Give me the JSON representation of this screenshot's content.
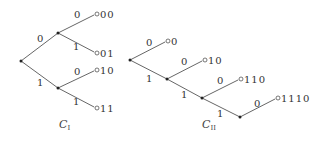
{
  "tree1": {
    "caption": "C",
    "caption_sub": "I",
    "edges": [
      {
        "from": [
          21,
          61
        ],
        "to": [
          58,
          33
        ],
        "label": "0",
        "lx": 37,
        "ly": 42
      },
      {
        "from": [
          21,
          61
        ],
        "to": [
          58,
          88
        ],
        "label": "1",
        "lx": 37,
        "ly": 86
      },
      {
        "from": [
          58,
          33
        ],
        "to": [
          96,
          14
        ],
        "label": "0",
        "lx": 74,
        "ly": 18
      },
      {
        "from": [
          58,
          33
        ],
        "to": [
          96,
          53
        ],
        "label": "1",
        "lx": 73,
        "ly": 50
      },
      {
        "from": [
          58,
          88
        ],
        "to": [
          96,
          70
        ],
        "label": "0",
        "lx": 74,
        "ly": 75
      },
      {
        "from": [
          58,
          88
        ],
        "to": [
          96,
          108
        ],
        "label": "1",
        "lx": 73,
        "ly": 105
      }
    ],
    "leaves": [
      {
        "x": 96,
        "y": 14,
        "code": "00"
      },
      {
        "x": 96,
        "y": 53,
        "code": "01"
      },
      {
        "x": 96,
        "y": 70,
        "code": "10"
      },
      {
        "x": 96,
        "y": 108,
        "code": "11"
      }
    ],
    "nodes": [
      [
        21,
        61
      ],
      [
        58,
        33
      ],
      [
        58,
        88
      ]
    ]
  },
  "tree2": {
    "caption": "C",
    "caption_sub": "II",
    "edges": [
      {
        "from": [
          130,
          60
        ],
        "to": [
          167,
          41
        ],
        "label": "0",
        "lx": 146,
        "ly": 46
      },
      {
        "from": [
          130,
          60
        ],
        "to": [
          167,
          79
        ],
        "label": "1",
        "lx": 146,
        "ly": 82
      },
      {
        "from": [
          167,
          79
        ],
        "to": [
          204,
          60
        ],
        "label": "0",
        "lx": 181,
        "ly": 65
      },
      {
        "from": [
          167,
          79
        ],
        "to": [
          202,
          98
        ],
        "label": "1",
        "lx": 181,
        "ly": 98
      },
      {
        "from": [
          202,
          98
        ],
        "to": [
          240,
          79
        ],
        "label": "0",
        "lx": 217,
        "ly": 84
      },
      {
        "from": [
          202,
          98
        ],
        "to": [
          240,
          117
        ],
        "label": "1",
        "lx": 217,
        "ly": 117
      },
      {
        "from": [
          240,
          117
        ],
        "to": [
          277,
          98
        ],
        "label": "0",
        "lx": 254,
        "ly": 107
      }
    ],
    "leaves": [
      {
        "x": 167,
        "y": 41,
        "code": "0"
      },
      {
        "x": 204,
        "y": 60,
        "code": "10"
      },
      {
        "x": 240,
        "y": 79,
        "code": "110"
      },
      {
        "x": 277,
        "y": 98,
        "code": "1110"
      }
    ],
    "nodes": [
      [
        130,
        60
      ],
      [
        167,
        79
      ],
      [
        202,
        98
      ],
      [
        240,
        117
      ]
    ]
  }
}
